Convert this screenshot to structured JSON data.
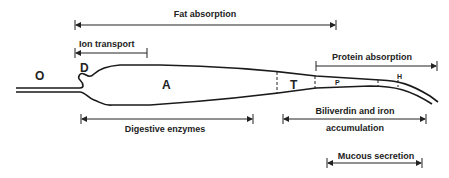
{
  "diagram": {
    "regions": {
      "O": "O",
      "D": "D",
      "A": "A",
      "T": "T",
      "P": "P",
      "H": "H"
    },
    "functions": {
      "fat_absorption": "Fat absorption",
      "ion_transport": "Ion transport",
      "protein_absorption": "Protein absorption",
      "digestive_enzymes": "Digestive enzymes",
      "biliverdin_line1": "Biliverdin and iron",
      "biliverdin_line2": "accumulation",
      "mucous_secretion": "Mucous secretion"
    }
  }
}
